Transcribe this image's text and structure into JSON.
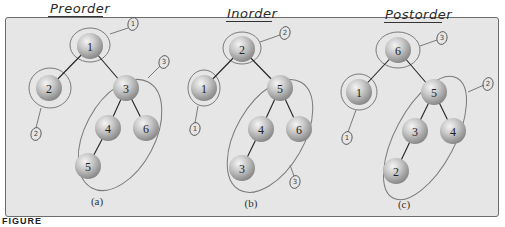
{
  "headings": [
    {
      "label": "Preorder",
      "x": 50,
      "y": 1
    },
    {
      "label": "Inorder",
      "x": 227,
      "y": 8
    },
    {
      "label": "Postorder",
      "x": 385,
      "y": 9
    }
  ],
  "figure_label": "FIGURE",
  "colors": {
    "panel_bg": "#e6e6e6",
    "node_fill_light": "#dcdcdc",
    "node_fill_dark": "#8f8f8f",
    "edge": "#222222",
    "annotation": "#6e6e6e"
  },
  "trees": [
    {
      "id": "a",
      "caption": "(a)",
      "traversal": "Preorder",
      "nodes": [
        {
          "id": "n1",
          "label": "1",
          "x": 90,
          "y": 46
        },
        {
          "id": "n2",
          "label": "2",
          "x": 49,
          "y": 88
        },
        {
          "id": "n3",
          "label": "3",
          "x": 126,
          "y": 88
        },
        {
          "id": "n4",
          "label": "4",
          "x": 108,
          "y": 128
        },
        {
          "id": "n6",
          "label": "6",
          "x": 146,
          "y": 128
        },
        {
          "id": "n5",
          "label": "5",
          "x": 88,
          "y": 166
        }
      ],
      "edges": [
        [
          "n1",
          "n2"
        ],
        [
          "n1",
          "n3"
        ],
        [
          "n3",
          "n4"
        ],
        [
          "n3",
          "n6"
        ],
        [
          "n4",
          "n5"
        ]
      ],
      "annotations": [
        {
          "label": "1",
          "x": 133,
          "y": 24
        },
        {
          "label": "2",
          "x": 36,
          "y": 134
        },
        {
          "label": "3",
          "x": 164,
          "y": 62
        }
      ]
    },
    {
      "id": "b",
      "caption": "(b)",
      "traversal": "Inorder",
      "nodes": [
        {
          "id": "n2",
          "label": "2",
          "x": 242,
          "y": 49
        },
        {
          "id": "n1",
          "label": "1",
          "x": 204,
          "y": 88
        },
        {
          "id": "n5",
          "label": "5",
          "x": 280,
          "y": 88
        },
        {
          "id": "n4",
          "label": "4",
          "x": 261,
          "y": 129
        },
        {
          "id": "n6",
          "label": "6",
          "x": 299,
          "y": 129
        },
        {
          "id": "n3",
          "label": "3",
          "x": 242,
          "y": 168
        }
      ],
      "edges": [
        [
          "n2",
          "n1"
        ],
        [
          "n2",
          "n5"
        ],
        [
          "n5",
          "n4"
        ],
        [
          "n5",
          "n6"
        ],
        [
          "n4",
          "n3"
        ]
      ],
      "annotations": [
        {
          "label": "2",
          "x": 285,
          "y": 33
        },
        {
          "label": "1",
          "x": 195,
          "y": 129
        },
        {
          "label": "3",
          "x": 295,
          "y": 182
        }
      ]
    },
    {
      "id": "c",
      "caption": "(c)",
      "traversal": "Postorder",
      "nodes": [
        {
          "id": "n6",
          "label": "6",
          "x": 398,
          "y": 50
        },
        {
          "id": "n1",
          "label": "1",
          "x": 359,
          "y": 92
        },
        {
          "id": "n5",
          "label": "5",
          "x": 434,
          "y": 92
        },
        {
          "id": "n3",
          "label": "3",
          "x": 415,
          "y": 131
        },
        {
          "id": "n4",
          "label": "4",
          "x": 453,
          "y": 131
        },
        {
          "id": "n2",
          "label": "2",
          "x": 396,
          "y": 171
        }
      ],
      "edges": [
        [
          "n6",
          "n1"
        ],
        [
          "n6",
          "n5"
        ],
        [
          "n5",
          "n3"
        ],
        [
          "n5",
          "n4"
        ],
        [
          "n3",
          "n2"
        ]
      ],
      "annotations": [
        {
          "label": "3",
          "x": 442,
          "y": 38
        },
        {
          "label": "1",
          "x": 347,
          "y": 138
        },
        {
          "label": "2",
          "x": 488,
          "y": 84
        }
      ]
    }
  ]
}
